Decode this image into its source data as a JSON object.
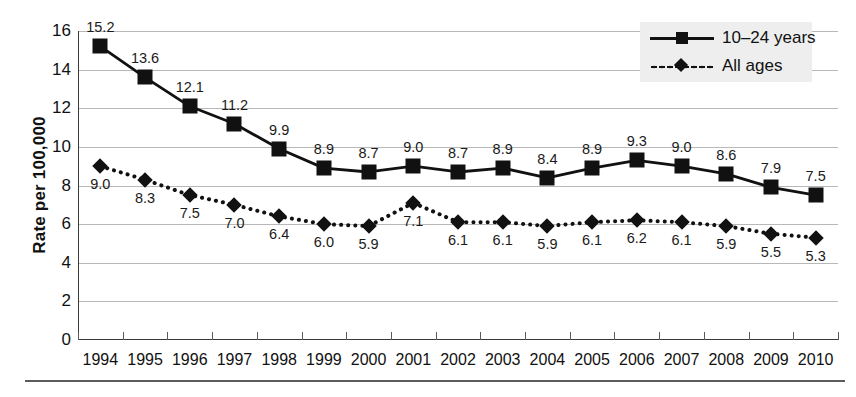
{
  "chart_data": {
    "type": "line",
    "title": "",
    "xlabel": "",
    "ylabel": "Rate per 100,000",
    "ylim": [
      0,
      16
    ],
    "ytick_step": 2,
    "yticks": [
      "0",
      "2",
      "4",
      "6",
      "8",
      "10",
      "12",
      "14",
      "16"
    ],
    "grid": true,
    "legend_position": "top-right",
    "categories": [
      "1994",
      "1995",
      "1996",
      "1997",
      "1998",
      "1999",
      "2000",
      "2001",
      "2002",
      "2003",
      "2004",
      "2005",
      "2006",
      "2007",
      "2008",
      "2009",
      "2010"
    ],
    "series": [
      {
        "name": "10–24 years",
        "marker": "square",
        "linestyle": "solid",
        "color": "#111111",
        "label_position": "above",
        "values": [
          15.2,
          13.6,
          12.1,
          11.2,
          9.9,
          8.9,
          8.7,
          9.0,
          8.7,
          8.9,
          8.4,
          8.9,
          9.3,
          9.0,
          8.6,
          7.9,
          7.5
        ],
        "value_labels": [
          "15.2",
          "13.6",
          "12.1",
          "11.2",
          "9.9",
          "8.9",
          "8.7",
          "9.0",
          "8.7",
          "8.9",
          "8.4",
          "8.9",
          "9.3",
          "9.0",
          "8.6",
          "7.9",
          "7.5"
        ]
      },
      {
        "name": "All ages",
        "marker": "diamond",
        "linestyle": "dotted",
        "color": "#111111",
        "label_position": "below",
        "values": [
          9.0,
          8.3,
          7.5,
          7.0,
          6.4,
          6.0,
          5.9,
          7.1,
          6.1,
          6.1,
          5.9,
          6.1,
          6.2,
          6.1,
          5.9,
          5.5,
          5.3
        ],
        "value_labels": [
          "9.0",
          "8.3",
          "7.5",
          "7.0",
          "6.4",
          "6.0",
          "5.9",
          "7.1",
          "6.1",
          "6.1",
          "5.9",
          "6.1",
          "6.2",
          "6.1",
          "5.9",
          "5.5",
          "5.3"
        ]
      }
    ]
  },
  "legend": {
    "items": [
      {
        "label": "10–24 years",
        "marker": "square",
        "linestyle": "solid"
      },
      {
        "label": "All ages",
        "marker": "diamond",
        "linestyle": "dotted"
      }
    ],
    "background": "#eeeeee"
  },
  "colors": {
    "series": "#111111",
    "gridline": "#b8b8b8",
    "axis": "#3a3a3a",
    "text": "#111111",
    "rule": "#5c5c5c"
  }
}
